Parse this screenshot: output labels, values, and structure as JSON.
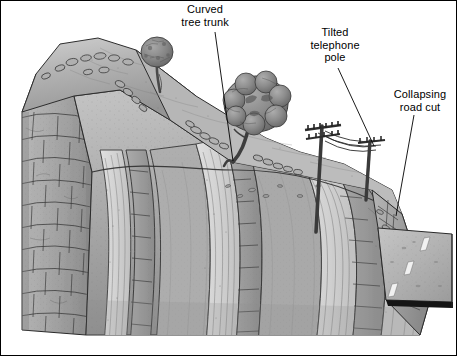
{
  "figure": {
    "border_color": "#000000",
    "background_color": "#ffffff"
  },
  "labels": [
    {
      "id": "curved-tree-trunk",
      "text": "Curved\ntree trunk",
      "leader_from": [
        215,
        32
      ],
      "leader_to": [
        233,
        161
      ]
    },
    {
      "id": "tilted-telephone-pole",
      "text": "Tilted\ntelephone\npole",
      "leader_from": [
        338,
        68
      ],
      "leader_to": [
        374,
        146
      ]
    },
    {
      "id": "collapsing-road-cut",
      "text": "Collapsing\nroad cut",
      "leader_from": [
        414,
        115
      ],
      "leader_to": [
        396,
        216
      ]
    }
  ],
  "palette": {
    "ink": "#1c1c1c",
    "soil_light": "#c2c2c2",
    "soil_mid": "#a8a8a8",
    "soil_dark": "#8d8d8d",
    "rock_light": "#c8c8c8",
    "rock_mid": "#ababab",
    "rock_dark": "#8a8a8a",
    "strata_pale": "#dcdcdc",
    "strata_band": "#9e9e9e",
    "foliage_dark": "#6e6e6e",
    "foliage_mid": "#929292",
    "trunk": "#4a4a4a",
    "pole": "#3a3a3a",
    "road_surface": "#b4b4b4",
    "road_stripe": "#f2f2f2",
    "road_edge": "#1a1a1a"
  },
  "scene": {
    "description": "Hillside block diagram illustrating downslope soil creep",
    "elements": [
      {
        "name": "hill-ridge",
        "kind": "landform"
      },
      {
        "name": "bedrock-left-face",
        "kind": "outcrop"
      },
      {
        "name": "tilted-strata-front-face",
        "kind": "outcrop"
      },
      {
        "name": "small-tree",
        "kind": "vegetation"
      },
      {
        "name": "large-tree",
        "kind": "vegetation"
      },
      {
        "name": "telephone-pole-left",
        "kind": "structure"
      },
      {
        "name": "telephone-pole-right",
        "kind": "structure"
      },
      {
        "name": "power-lines",
        "kind": "structure"
      },
      {
        "name": "road-surface",
        "kind": "structure"
      },
      {
        "name": "road-cut-scarp",
        "kind": "landform"
      }
    ],
    "road": {
      "stripe_count": 3
    },
    "strata_bands": 7
  }
}
